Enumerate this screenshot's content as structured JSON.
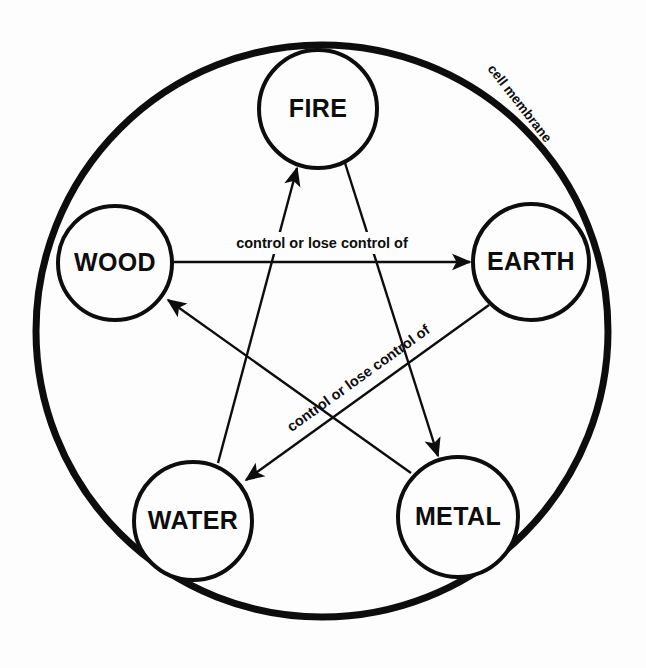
{
  "diagram": {
    "type": "cycle-diagram",
    "background_color": "#fdfdfd",
    "stroke_color": "#0d0d0d",
    "boundary": {
      "name": "cell membrane",
      "label": "cell membrane",
      "shape": "circle",
      "center": [
        322,
        331
      ],
      "radius": 286,
      "stroke_width": 7
    },
    "nodes": [
      {
        "id": "fire",
        "label": "FIRE",
        "cx": 318,
        "cy": 109,
        "r": 59,
        "stroke_width": 4
      },
      {
        "id": "wood",
        "label": "WOOD",
        "cx": 115,
        "cy": 263,
        "r": 57,
        "stroke_width": 4
      },
      {
        "id": "earth",
        "label": "EARTH",
        "cx": 531,
        "cy": 262,
        "r": 58,
        "stroke_width": 4
      },
      {
        "id": "water",
        "label": "WATER",
        "cx": 193,
        "cy": 521,
        "r": 59,
        "stroke_width": 4
      },
      {
        "id": "metal",
        "label": "METAL",
        "cx": 458,
        "cy": 517,
        "r": 60,
        "stroke_width": 4
      }
    ],
    "edges": [
      {
        "id": "wood-earth",
        "from": "wood",
        "to": "earth",
        "x1": 174,
        "y1": 262,
        "x2": 470,
        "y2": 262,
        "arrow": "end"
      },
      {
        "id": "earth-water",
        "from": "earth",
        "to": "water",
        "x1": 489,
        "y1": 305,
        "x2": 246,
        "y2": 480,
        "arrow": "end"
      },
      {
        "id": "water-fire",
        "from": "water",
        "to": "fire",
        "x1": 218,
        "y1": 463,
        "x2": 297,
        "y2": 168,
        "arrow": "end"
      },
      {
        "id": "fire-metal",
        "from": "fire",
        "to": "metal",
        "x1": 345,
        "y1": 163,
        "x2": 438,
        "y2": 456,
        "arrow": "end"
      },
      {
        "id": "metal-wood",
        "from": "metal",
        "to": "wood",
        "x1": 411,
        "y1": 473,
        "x2": 168,
        "y2": 300,
        "arrow": "end"
      }
    ],
    "edge_labels": [
      {
        "id": "label-wood-earth",
        "text": "control or lose control of",
        "x": 322,
        "y": 244,
        "rotation": 0
      },
      {
        "id": "label-earth-water",
        "text": "control or lose control of",
        "x": 359,
        "y": 379,
        "rotation": -35.7
      }
    ],
    "membrane_label": {
      "text": "cell membrane",
      "x": 519,
      "y": 104,
      "rotation": 52
    }
  }
}
